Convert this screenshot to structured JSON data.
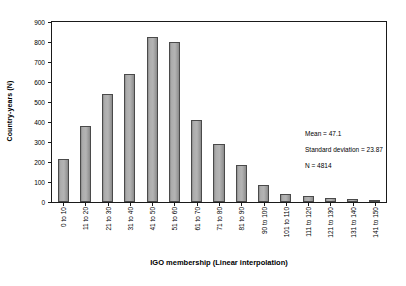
{
  "chart_data": {
    "type": "bar",
    "title": "",
    "xlabel": "IGO membership (Linear interpolation)",
    "ylabel": "Country-years (N)",
    "categories": [
      "0 to 10",
      "11 to 20",
      "21 to 30",
      "31 to 40",
      "41 to 50",
      "51 to 60",
      "61 to 70",
      "71 to 80",
      "81 to 90",
      "90 to 100",
      "101 to 110",
      "111 to 120",
      "121 to 130",
      "131 to 140",
      "141 to 150"
    ],
    "values": [
      215,
      378,
      540,
      640,
      825,
      800,
      408,
      292,
      185,
      85,
      38,
      28,
      22,
      15,
      8
    ],
    "ylim": [
      0,
      900
    ],
    "yticks": [
      0,
      100,
      200,
      300,
      400,
      500,
      600,
      700,
      800,
      900
    ],
    "ytick_labels": [
      "0",
      "100",
      "200",
      "300",
      "400",
      "500",
      "600",
      "700",
      "800",
      "900"
    ],
    "grid": false,
    "legend": null,
    "bar_color": "#b0b0b0",
    "bar_edge_color": "#4a4a4a",
    "annotations": [
      "Mean = 47.1",
      "Standard deviation = 23.87",
      "N = 4814"
    ]
  }
}
